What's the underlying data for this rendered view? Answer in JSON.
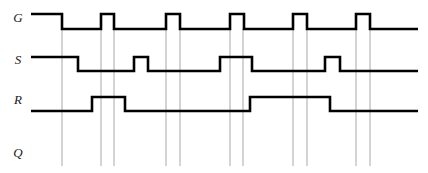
{
  "diagram": {
    "type": "digital-timing-waveform",
    "width": 428,
    "height": 173,
    "background_color": "#ffffff",
    "waveform_color": "#000000",
    "gridline_color": "#a8a8a8",
    "label_color": "#1a1a1a"
  },
  "axes": {
    "time_start_px": 31,
    "time_end_px": 418,
    "gridline_top_px": 28,
    "gridline_bottom_px": 166
  },
  "signals": [
    {
      "name": "G",
      "label": "G",
      "label_x": 18,
      "label_y": 22,
      "high_y": 14,
      "low_y": 29,
      "initial_level": "high",
      "transitions_px": [
        62,
        101,
        114,
        166,
        180,
        230,
        244,
        293,
        307,
        356,
        370
      ],
      "description": "Gate/enable: starts high, falls at 62, then five narrow enable pulses"
    },
    {
      "name": "S",
      "label": "S",
      "label_x": 18,
      "label_y": 64,
      "high_y": 57,
      "low_y": 71,
      "initial_level": "high",
      "transitions_px": [
        78,
        134,
        148,
        220,
        252,
        325,
        340
      ],
      "description": "Set input: starts high, falls at 78, pulses, long high 220-252, pulse 325-340"
    },
    {
      "name": "R",
      "label": "R",
      "label_x": 18,
      "label_y": 104,
      "high_y": 97,
      "low_y": 111,
      "initial_level": "low",
      "transitions_px": [
        92,
        125,
        250,
        330
      ],
      "description": "Reset input: starts low, pulse 92-125, long high 250-330"
    },
    {
      "name": "Q",
      "label": "Q",
      "label_x": 18,
      "label_y": 157,
      "high_y": 140,
      "low_y": 154,
      "initial_level": "none",
      "transitions_px": [],
      "description": "Output row: label only, waveform left blank to be filled in"
    }
  ],
  "gridlines_px": [
    62,
    101,
    114,
    166,
    180,
    230,
    243,
    293,
    307,
    356,
    370
  ]
}
